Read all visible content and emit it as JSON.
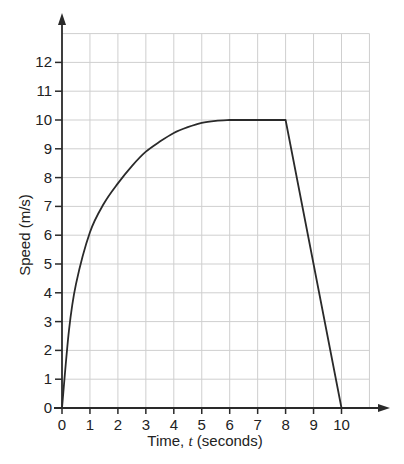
{
  "chart_data": {
    "type": "line",
    "title": "",
    "xlabel": "Time, t (seconds)",
    "xlabel_parts": [
      "Time, ",
      "t",
      " (seconds)"
    ],
    "ylabel": "Speed (m/s)",
    "xlim": [
      0,
      11
    ],
    "ylim": [
      0,
      13
    ],
    "grid": true,
    "legend": null,
    "x_ticks": [
      0,
      1,
      2,
      3,
      4,
      5,
      6,
      7,
      8,
      9,
      10
    ],
    "y_ticks": [
      0,
      1,
      2,
      3,
      4,
      5,
      6,
      7,
      8,
      9,
      10,
      11,
      12
    ],
    "series": [
      {
        "name": "Speed",
        "x": [
          0,
          0.25,
          0.5,
          1,
          1.5,
          2,
          2.5,
          3,
          3.5,
          4,
          4.5,
          5,
          5.5,
          6,
          7,
          8,
          10
        ],
        "y": [
          0,
          2.7,
          4.3,
          6.1,
          7.1,
          7.8,
          8.4,
          8.9,
          9.25,
          9.55,
          9.75,
          9.9,
          9.97,
          10,
          10,
          10,
          0
        ]
      }
    ],
    "segments": [
      {
        "from": 0,
        "to": 6,
        "shape": "concave curve rising from 0 to 10 m/s"
      },
      {
        "from": 6,
        "to": 8,
        "shape": "constant 10 m/s"
      },
      {
        "from": 8,
        "to": 10,
        "shape": "straight line decreasing from 10 to 0 m/s"
      }
    ]
  }
}
